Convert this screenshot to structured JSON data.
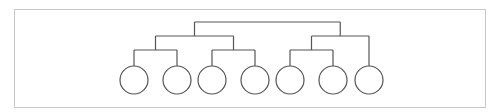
{
  "diagram": {
    "type": "binary-tree",
    "leaf_count": 7,
    "leaves": [
      {
        "id": "leaf-1",
        "label": ""
      },
      {
        "id": "leaf-2",
        "label": ""
      },
      {
        "id": "leaf-3",
        "label": ""
      },
      {
        "id": "leaf-4",
        "label": ""
      },
      {
        "id": "leaf-5",
        "label": ""
      },
      {
        "id": "leaf-6",
        "label": ""
      },
      {
        "id": "leaf-7",
        "label": ""
      }
    ],
    "tree": {
      "id": "root",
      "children": [
        {
          "id": "group-left",
          "children": [
            {
              "id": "pair-a",
              "children": [
                {
                  "leaf": 0
                },
                {
                  "leaf": 1
                }
              ]
            },
            {
              "id": "pair-b",
              "children": [
                {
                  "leaf": 2
                },
                {
                  "leaf": 3
                }
              ]
            }
          ]
        },
        {
          "id": "group-right",
          "children": [
            {
              "id": "pair-c",
              "children": [
                {
                  "leaf": 4
                },
                {
                  "leaf": 5
                }
              ]
            },
            {
              "leaf": 6
            }
          ]
        }
      ]
    },
    "colors": {
      "line": "#555555",
      "frame": "#c8c8c8",
      "background": "#ffffff"
    }
  }
}
